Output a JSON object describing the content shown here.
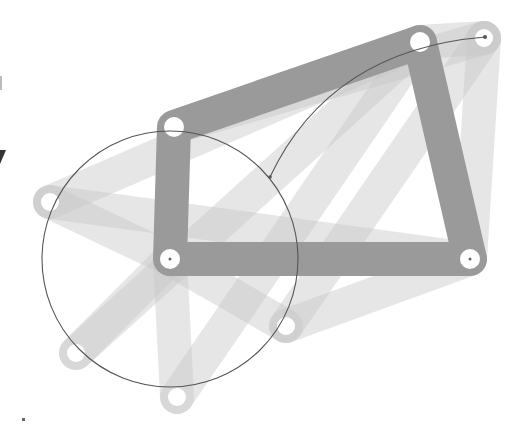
{
  "diagram": {
    "colors": {
      "background": "#ffffff",
      "main_link": "#9a9a9a",
      "ghost_link": "#c8c8c8",
      "ghost_opacity": 0.45,
      "joint_hole": "#ffffff",
      "trajectory": "#555555",
      "pin_dot": "#666666",
      "edge_mark": "#333333"
    },
    "main_linkage": {
      "link_width": 34,
      "joints": [
        {
          "id": "top-left",
          "x": 174,
          "y": 127
        },
        {
          "id": "top-right",
          "x": 420,
          "y": 42
        },
        {
          "id": "bottom-right",
          "x": 470,
          "y": 259
        },
        {
          "id": "bottom-left",
          "x": 170,
          "y": 259
        }
      ]
    },
    "ghost_links": [
      {
        "from": [
          170,
          259
        ],
        "to": [
          50,
          202
        ]
      },
      {
        "from": [
          170,
          259
        ],
        "to": [
          76,
          353
        ]
      },
      {
        "from": [
          170,
          259
        ],
        "to": [
          177,
          397
        ]
      },
      {
        "from": [
          170,
          259
        ],
        "to": [
          286,
          326
        ]
      },
      {
        "from": [
          420,
          42
        ],
        "to": [
          484,
          38
        ]
      },
      {
        "from": [
          484,
          38
        ],
        "to": [
          470,
          259
        ]
      },
      {
        "from": [
          50,
          202
        ],
        "to": [
          420,
          42
        ]
      },
      {
        "from": [
          76,
          353
        ],
        "to": [
          420,
          42
        ]
      },
      {
        "from": [
          177,
          397
        ],
        "to": [
          420,
          42
        ]
      },
      {
        "from": [
          286,
          326
        ],
        "to": [
          484,
          38
        ]
      },
      {
        "from": [
          174,
          127
        ],
        "to": [
          484,
          38
        ]
      },
      {
        "from": [
          50,
          202
        ],
        "to": [
          470,
          259
        ]
      },
      {
        "from": [
          286,
          326
        ],
        "to": [
          470,
          259
        ]
      }
    ],
    "ghost_joints": [
      {
        "x": 50,
        "y": 202
      },
      {
        "x": 76,
        "y": 353
      },
      {
        "x": 177,
        "y": 397
      },
      {
        "x": 286,
        "y": 326
      },
      {
        "x": 484,
        "y": 38
      }
    ],
    "trajectory": {
      "circle": {
        "cx": 170,
        "cy": 259,
        "r": 128
      },
      "arc": {
        "start": [
          270,
          177
        ],
        "control": [
          330,
          50
        ],
        "end": [
          485,
          37
        ]
      },
      "coupler_point": {
        "x": 270,
        "y": 177
      }
    }
  }
}
